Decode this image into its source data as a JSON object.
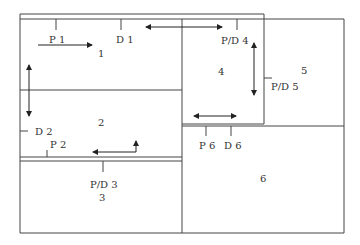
{
  "diagram": {
    "areas": [
      {
        "id": "area-1",
        "label": "1"
      },
      {
        "id": "area-2",
        "label": "2"
      },
      {
        "id": "area-3",
        "label": "3"
      },
      {
        "id": "area-4",
        "label": "4"
      },
      {
        "id": "area-5",
        "label": "5"
      },
      {
        "id": "area-6",
        "label": "6"
      }
    ],
    "points": [
      {
        "id": "p1",
        "label": "P 1"
      },
      {
        "id": "d1",
        "label": "D 1"
      },
      {
        "id": "pd4",
        "label": "P/D 4"
      },
      {
        "id": "pd5",
        "label": "P/D 5"
      },
      {
        "id": "d2",
        "label": "D 2"
      },
      {
        "id": "p2",
        "label": "P 2"
      },
      {
        "id": "pd3",
        "label": "P/D 3"
      },
      {
        "id": "p6",
        "label": "P 6"
      },
      {
        "id": "d6",
        "label": "D 6"
      }
    ],
    "line_color": "#444444"
  }
}
